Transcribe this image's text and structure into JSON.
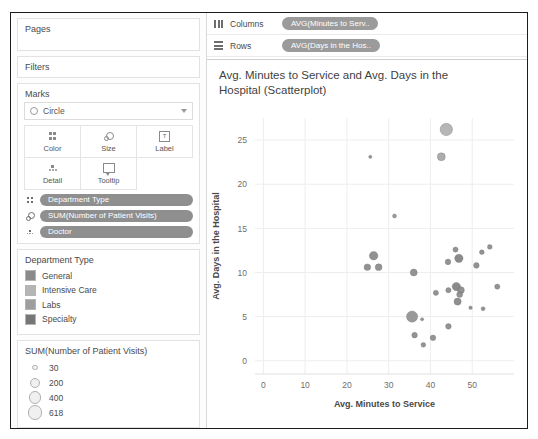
{
  "panels": {
    "pages": {
      "title": "Pages"
    },
    "filters": {
      "title": "Filters"
    },
    "marks": {
      "title": "Marks",
      "mark_type": "Circle",
      "buttons": [
        {
          "label": "Color",
          "icon": "color-icon"
        },
        {
          "label": "Size",
          "icon": "size-icon"
        },
        {
          "label": "Label",
          "icon": "label-icon"
        },
        {
          "label": "Detail",
          "icon": "detail-icon"
        },
        {
          "label": "Tooltip",
          "icon": "tooltip-icon"
        }
      ],
      "pills": [
        {
          "label": "Department Type",
          "icon": "color-icon"
        },
        {
          "label": "SUM(Number of Patient Visits)",
          "icon": "size-icon"
        },
        {
          "label": "Doctor",
          "icon": "detail-icon"
        }
      ]
    }
  },
  "color_legend": {
    "title": "Department Type",
    "items": [
      {
        "label": "General",
        "color": "#8a8a8a"
      },
      {
        "label": "Intensive Care",
        "color": "#b5b5b5"
      },
      {
        "label": "Labs",
        "color": "#9e9e9e"
      },
      {
        "label": "Specialty",
        "color": "#767676"
      }
    ]
  },
  "size_legend": {
    "title": "SUM(Number of Patient Visits)",
    "items": [
      {
        "value": "30",
        "radius": 1.8
      },
      {
        "value": "200",
        "radius": 4.0
      },
      {
        "value": "400",
        "radius": 5.2
      },
      {
        "value": "618",
        "radius": 6.2
      }
    ]
  },
  "shelves": {
    "columns": {
      "label": "Columns",
      "pill": "AVG(Minutes to Serv.."
    },
    "rows": {
      "label": "Rows",
      "pill": "AVG(Days in the Hos.."
    }
  },
  "chart_data": {
    "type": "scatter",
    "title": "Avg. Minutes to Service and Avg. Days in the Hospital (Scatterplot)",
    "xlabel": "Avg. Minutes to Service",
    "ylabel": "Avg. Days in the Hospital",
    "xticks": [
      0,
      10,
      20,
      30,
      40,
      50
    ],
    "yticks": [
      0,
      5,
      10,
      15,
      20,
      25
    ],
    "xlim": [
      -2,
      60
    ],
    "ylim": [
      -1.5,
      27.5
    ],
    "grid": true,
    "legend_position": "left-panel",
    "size_field": "SUM(Number of Patient Visits)",
    "color_field": "Department Type",
    "points": [
      {
        "x": 43.8,
        "y": 26.2,
        "r": 6.2,
        "c": "#b0b0b0"
      },
      {
        "x": 42.6,
        "y": 23.1,
        "r": 4.0,
        "c": "#a5a5a5"
      },
      {
        "x": 25.6,
        "y": 23.1,
        "r": 1.6,
        "c": "#8a8a8a"
      },
      {
        "x": 31.4,
        "y": 16.4,
        "r": 2.0,
        "c": "#8f8f8f"
      },
      {
        "x": 26.4,
        "y": 11.9,
        "r": 4.3,
        "c": "#888888"
      },
      {
        "x": 24.9,
        "y": 10.6,
        "r": 3.3,
        "c": "#8a8a8a"
      },
      {
        "x": 27.6,
        "y": 10.6,
        "r": 3.4,
        "c": "#8a8a8a"
      },
      {
        "x": 46.0,
        "y": 12.6,
        "r": 2.6,
        "c": "#8a8a8a"
      },
      {
        "x": 52.3,
        "y": 12.3,
        "r": 2.4,
        "c": "#8a8a8a"
      },
      {
        "x": 54.2,
        "y": 12.9,
        "r": 2.4,
        "c": "#8a8a8a"
      },
      {
        "x": 46.8,
        "y": 11.6,
        "r": 4.2,
        "c": "#808080"
      },
      {
        "x": 44.2,
        "y": 11.2,
        "r": 2.8,
        "c": "#8a8a8a"
      },
      {
        "x": 51.0,
        "y": 10.8,
        "r": 2.8,
        "c": "#8a8a8a"
      },
      {
        "x": 36.0,
        "y": 10.0,
        "r": 3.5,
        "c": "#8a8a8a"
      },
      {
        "x": 46.2,
        "y": 8.4,
        "r": 4.2,
        "c": "#808080"
      },
      {
        "x": 47.3,
        "y": 8.0,
        "r": 3.4,
        "c": "#8a8a8a"
      },
      {
        "x": 47.0,
        "y": 7.5,
        "r": 3.0,
        "c": "#8a8a8a"
      },
      {
        "x": 46.5,
        "y": 6.7,
        "r": 3.6,
        "c": "#858585"
      },
      {
        "x": 44.3,
        "y": 8.0,
        "r": 2.6,
        "c": "#8a8a8a"
      },
      {
        "x": 41.3,
        "y": 7.7,
        "r": 2.6,
        "c": "#8a8a8a"
      },
      {
        "x": 49.6,
        "y": 6.0,
        "r": 1.8,
        "c": "#8a8a8a"
      },
      {
        "x": 52.6,
        "y": 5.9,
        "r": 2.0,
        "c": "#8a8a8a"
      },
      {
        "x": 56.0,
        "y": 8.4,
        "r": 2.6,
        "c": "#8a8a8a"
      },
      {
        "x": 35.6,
        "y": 5.0,
        "r": 5.6,
        "c": "#909090"
      },
      {
        "x": 38.0,
        "y": 4.7,
        "r": 1.6,
        "c": "#8a8a8a"
      },
      {
        "x": 44.3,
        "y": 3.9,
        "r": 2.8,
        "c": "#8a8a8a"
      },
      {
        "x": 36.2,
        "y": 2.9,
        "r": 2.8,
        "c": "#8a8a8a"
      },
      {
        "x": 40.6,
        "y": 2.6,
        "r": 2.8,
        "c": "#8a8a8a"
      },
      {
        "x": 38.3,
        "y": 1.8,
        "r": 2.4,
        "c": "#8a8a8a"
      }
    ]
  }
}
